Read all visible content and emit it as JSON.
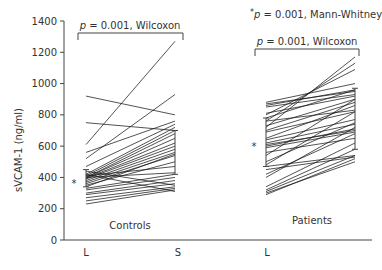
{
  "chart_data": {
    "type": "line",
    "subtype": "paired-slope",
    "title": "",
    "ylabel": "sVCAM-1 (ng/ml)",
    "xlabel": "",
    "ylim": [
      0,
      1400
    ],
    "yticks": [
      0,
      200,
      400,
      600,
      800,
      1000,
      1200,
      1400
    ],
    "xtick_labels": [
      "L",
      "S",
      "L"
    ],
    "groups": [
      {
        "name": "Controls",
        "pairs": [
          [
            920,
            800
          ],
          [
            750,
            700
          ],
          [
            610,
            1270
          ],
          [
            520,
            930
          ],
          [
            560,
            760
          ],
          [
            470,
            740
          ],
          [
            420,
            720
          ],
          [
            410,
            700
          ],
          [
            400,
            680
          ],
          [
            400,
            650
          ],
          [
            395,
            620
          ],
          [
            390,
            600
          ],
          [
            380,
            580
          ],
          [
            370,
            560
          ],
          [
            360,
            540
          ],
          [
            350,
            500
          ],
          [
            410,
            470
          ],
          [
            400,
            430
          ],
          [
            330,
            420
          ],
          [
            320,
            400
          ],
          [
            300,
            380
          ],
          [
            290,
            360
          ],
          [
            270,
            340
          ],
          [
            250,
            330
          ],
          [
            230,
            320
          ],
          [
            420,
            310
          ],
          [
            440,
            350
          ],
          [
            340,
            550
          ]
        ],
        "median_L": 410,
        "iqr_L": [
          340,
          450
        ],
        "median_S": 560,
        "iqr_S": [
          420,
          700
        ]
      },
      {
        "name": "Patients",
        "pairs": [
          [
            720,
            1170
          ],
          [
            760,
            1130
          ],
          [
            800,
            1090
          ],
          [
            880,
            1000
          ],
          [
            870,
            950
          ],
          [
            860,
            960
          ],
          [
            850,
            930
          ],
          [
            810,
            920
          ],
          [
            780,
            960
          ],
          [
            760,
            830
          ],
          [
            730,
            900
          ],
          [
            700,
            880
          ],
          [
            690,
            820
          ],
          [
            650,
            860
          ],
          [
            640,
            770
          ],
          [
            620,
            740
          ],
          [
            610,
            700
          ],
          [
            600,
            710
          ],
          [
            590,
            690
          ],
          [
            560,
            650
          ],
          [
            540,
            900
          ],
          [
            500,
            750
          ],
          [
            480,
            820
          ],
          [
            470,
            540
          ],
          [
            450,
            530
          ],
          [
            420,
            680
          ],
          [
            400,
            720
          ],
          [
            340,
            620
          ],
          [
            320,
            580
          ],
          [
            310,
            540
          ],
          [
            300,
            500
          ],
          [
            290,
            520
          ]
        ],
        "median_L": 600,
        "iqr_L": [
          470,
          780
        ],
        "median_S": 710,
        "iqr_S": [
          580,
          970
        ]
      }
    ],
    "annotations": {
      "controls_test": "p = 0.001, Wilcoxon",
      "patients_test": "p = 0.001, Wilcoxon",
      "between_test": "p = 0.001, Mann-Whitney",
      "asterisk": "*"
    },
    "grid": false,
    "legend": null
  },
  "labels": {
    "ylabel": "sVCAM-1 (ng/ml)",
    "controls": "Controls",
    "patients": "Patients",
    "x_L1": "L",
    "x_S": "S",
    "x_L2": "L",
    "p_letter": "p",
    "wilcoxon_rest": " = 0.001, Wilcoxon",
    "mann_rest": " = 0.001, Mann-Whitney",
    "star": "*"
  }
}
